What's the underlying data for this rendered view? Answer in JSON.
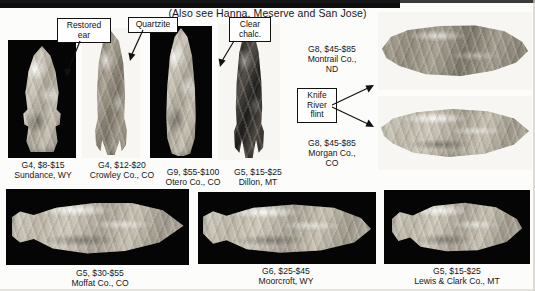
{
  "page": {
    "header_note": "(Also see Hanna, Meserve and San Jose)"
  },
  "callouts": [
    {
      "id": "restored-ear",
      "lines": [
        "Restored",
        "ear"
      ]
    },
    {
      "id": "quartzite",
      "lines": [
        "Quartzite"
      ]
    },
    {
      "id": "clear-chalc",
      "lines": [
        "Clear",
        "chalc."
      ]
    },
    {
      "id": "knife-river-flint",
      "lines": [
        "Knife",
        "River",
        "flint"
      ]
    }
  ],
  "specimens": [
    {
      "id": "sundance-wy",
      "grade_price": "G4, $8-$15",
      "locality": "Sundance, WY",
      "background": "black",
      "orientation": "vertical",
      "tone": "light"
    },
    {
      "id": "crowley-co",
      "grade_price": "G4, $12-$20",
      "locality": "Crowley Co., CO",
      "background": "white",
      "orientation": "vertical",
      "tone": "mid"
    },
    {
      "id": "otero-co",
      "grade_price": "G9, $55-$100",
      "locality": "Otero Co., CO",
      "background": "black",
      "orientation": "vertical",
      "tone": "light"
    },
    {
      "id": "dillon-mt",
      "grade_price": "G5, $15-$25",
      "locality": "Dillon, MT",
      "background": "white",
      "orientation": "vertical",
      "tone": "dark"
    },
    {
      "id": "montrail-co-nd",
      "grade_price": "G8, $45-$85",
      "locality": "Montrail Co., ND",
      "locality_line1": "Montrail Co.,",
      "locality_line2": "ND",
      "background": "white",
      "orientation": "horizontal",
      "tone": "mid"
    },
    {
      "id": "morgan-co-co",
      "grade_price": "G8, $45-$85",
      "locality": "Morgan Co., CO",
      "locality_line1": "Morgan Co.,",
      "locality_line2": "CO",
      "background": "white",
      "orientation": "horizontal",
      "tone": "light"
    },
    {
      "id": "bottom-left",
      "grade_price": "G5, $30-$55",
      "locality": "Moffat Co., CO",
      "background": "black",
      "orientation": "horizontal",
      "tone": "light"
    },
    {
      "id": "moorcroft-wy",
      "grade_price": "G6, $25-$45",
      "locality": "Moorcroft, WY",
      "background": "black",
      "orientation": "horizontal",
      "tone": "light"
    },
    {
      "id": "lewis-clark-mt",
      "grade_price": "G5, $15-$25",
      "locality": "Lewis & Clark Co., MT",
      "background": "black",
      "orientation": "horizontal",
      "tone": "light"
    }
  ]
}
